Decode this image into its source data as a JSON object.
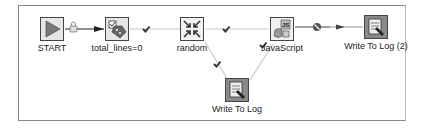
{
  "diagram": {
    "type": "workflow",
    "nodes": [
      {
        "id": "start",
        "label": "START",
        "icon": "play-icon"
      },
      {
        "id": "total_lines",
        "label": "total_lines=0",
        "icon": "set-variable-icon"
      },
      {
        "id": "random",
        "label": "random",
        "icon": "shrink-arrows-icon"
      },
      {
        "id": "javascript",
        "label": "JavaScript",
        "icon": "javascript-icon"
      },
      {
        "id": "write_log_2",
        "label": "Write To Log (2)",
        "icon": "write-log-icon"
      },
      {
        "id": "write_log",
        "label": "Write To Log",
        "icon": "write-log-icon"
      }
    ],
    "hops": [
      {
        "from": "START",
        "to": "total_lines=0",
        "type": "unconditional",
        "marker": "lock-icon"
      },
      {
        "from": "total_lines=0",
        "to": "random",
        "type": "success",
        "marker": "check-icon"
      },
      {
        "from": "random",
        "to": "JavaScript",
        "type": "success",
        "marker": "check-icon"
      },
      {
        "from": "random",
        "to": "Write To Log",
        "type": "success",
        "marker": "check-icon"
      },
      {
        "from": "JavaScript",
        "to": "Write To Log",
        "type": "success",
        "marker": "check-icon"
      },
      {
        "from": "JavaScript",
        "to": "Write To Log (2)",
        "type": "failure",
        "marker": "no-entry-icon"
      }
    ]
  }
}
